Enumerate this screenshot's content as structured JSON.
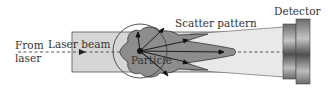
{
  "diagram": {
    "labels": {
      "from_laser_line1": "From",
      "from_laser_line2": "laser",
      "laser_beam": "Laser beam",
      "scatter_pattern": "Scatter pattern",
      "particle": "Particle",
      "detector": "Detector"
    },
    "colors": {
      "tube_fill": "#d4d4d4",
      "tube_stroke": "#555555",
      "scatter_fill": "#8c8c8c",
      "particle": "#111111",
      "detector_dark": "#555555",
      "detector_light": "#b5b5b5",
      "text": "#333333"
    }
  }
}
